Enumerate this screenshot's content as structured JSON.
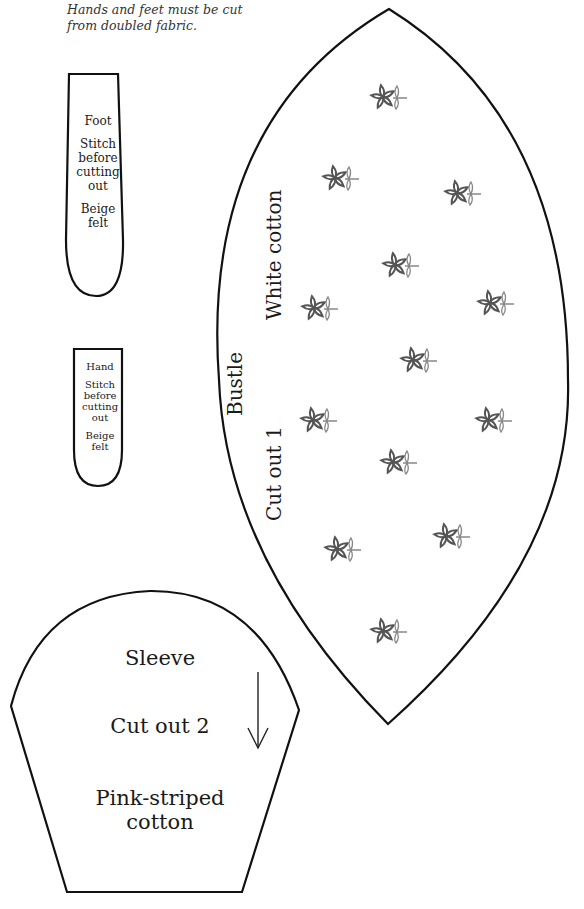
{
  "instructions": {
    "note_line1": "Hands and feet must be cut",
    "note_line2": "from doubled fabric."
  },
  "foot_piece": {
    "name": "Foot",
    "instruction_lines": [
      "Stitch",
      "before",
      "cutting",
      "out"
    ],
    "material_lines": [
      "Beige",
      "felt"
    ]
  },
  "hand_piece": {
    "name": "Hand",
    "instruction_lines": [
      "Stitch",
      "before",
      "cutting",
      "out"
    ],
    "material_lines": [
      "Beige",
      "felt"
    ]
  },
  "bustle_piece": {
    "name": "Bustle",
    "material": "White cotton",
    "quantity": "Cut out 1",
    "flower_count": 13
  },
  "sleeve_piece": {
    "name": "Sleeve",
    "quantity": "Cut out 2",
    "material_line1": "Pink-striped",
    "material_line2": "cotton",
    "grain_arrow": "down-arrow"
  },
  "colors": {
    "outline": "#111111",
    "flower": "#555555",
    "leaf": "#888888"
  }
}
